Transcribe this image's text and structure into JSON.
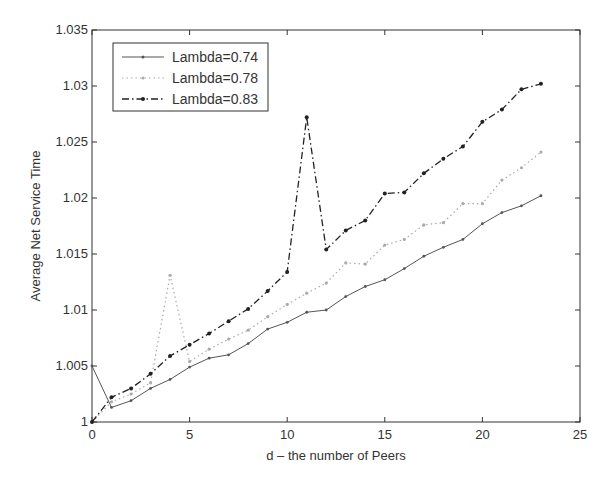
{
  "chart_data": {
    "type": "line",
    "title": "",
    "xlabel": "d – the number of Peers",
    "ylabel": "Average Net Service Time",
    "xlim": [
      0,
      25
    ],
    "ylim": [
      1.0,
      1.035
    ],
    "xticks": [
      0,
      5,
      10,
      15,
      20,
      25
    ],
    "xtick_labels": [
      "0",
      "5",
      "10",
      "15",
      "20",
      "25"
    ],
    "yticks": [
      1.0,
      1.005,
      1.01,
      1.015,
      1.02,
      1.025,
      1.03,
      1.035
    ],
    "ytick_labels": [
      "1",
      "1.005",
      "1.01",
      "1.015",
      "1.02",
      "1.025",
      "1.03",
      "1.035"
    ],
    "grid": false,
    "legend_position": "top-left",
    "x": [
      0,
      1,
      2,
      3,
      4,
      5,
      6,
      7,
      8,
      9,
      10,
      11,
      12,
      13,
      14,
      15,
      16,
      17,
      18,
      19,
      20,
      21,
      22,
      23
    ],
    "series": [
      {
        "name": "Lambda=0.74",
        "style": "solid",
        "color": "#555555",
        "values": [
          1.005,
          1.0013,
          1.0019,
          1.003,
          1.0038,
          1.0049,
          1.0057,
          1.006,
          1.007,
          1.0083,
          1.0089,
          1.0098,
          1.01,
          1.0112,
          1.0121,
          1.0127,
          1.0137,
          1.0148,
          1.0156,
          1.0163,
          1.0177,
          1.0187,
          1.0193,
          1.0202
        ]
      },
      {
        "name": "Lambda=0.78",
        "style": "dotted",
        "color": "#aaaaaa",
        "values": [
          1.0,
          1.0018,
          1.0025,
          1.0035,
          1.0131,
          1.0054,
          1.0065,
          1.0074,
          1.0082,
          1.0094,
          1.0105,
          1.0115,
          1.0124,
          1.0142,
          1.0141,
          1.0158,
          1.0163,
          1.0176,
          1.0178,
          1.0195,
          1.0195,
          1.0216,
          1.0227,
          1.0241
        ]
      },
      {
        "name": "Lambda=0.83",
        "style": "dash-dot",
        "color": "#222222",
        "values": [
          1.0,
          1.0022,
          1.003,
          1.0043,
          1.0059,
          1.0069,
          1.0079,
          1.009,
          1.0101,
          1.0117,
          1.0134,
          1.0272,
          1.0154,
          1.0171,
          1.018,
          1.0204,
          1.0205,
          1.0222,
          1.0235,
          1.0246,
          1.0268,
          1.0279,
          1.0297,
          1.0302
        ]
      }
    ]
  }
}
